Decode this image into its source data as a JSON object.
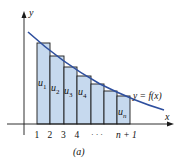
{
  "figure": {
    "caption": "(a)",
    "axis_labels": {
      "x": "x",
      "y": "y"
    },
    "curve_label": "y = f(x)",
    "tick_labels": [
      "1",
      "2",
      "3",
      "4",
      "· · ·",
      "n + 1"
    ],
    "bar_labels": [
      "u1",
      "u2",
      "u3",
      "u4",
      "un"
    ],
    "bar_label_parts": [
      {
        "base": "u",
        "sub": "1"
      },
      {
        "base": "u",
        "sub": "2"
      },
      {
        "base": "u",
        "sub": "3"
      },
      {
        "base": "u",
        "sub": "4"
      },
      {
        "base": "u",
        "sub": "n"
      }
    ],
    "colors": {
      "bar_fill": "#c6d9ee",
      "bar_stroke": "#1a1a1a",
      "curve": "#2e4f9e",
      "axis": "#1a1a1a"
    }
  }
}
